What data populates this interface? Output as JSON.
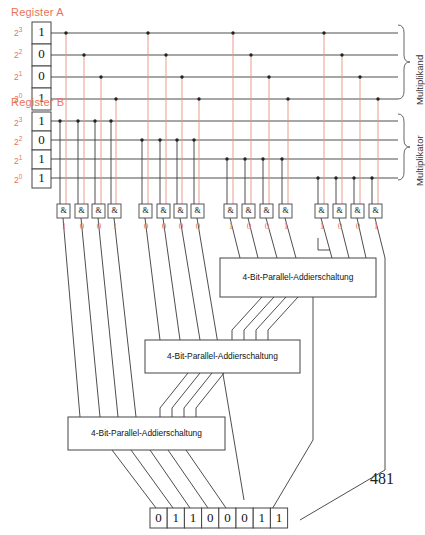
{
  "page": {
    "number": "481"
  },
  "registers": {
    "a": {
      "title": "Register A",
      "side_label": "Multiplikand",
      "bit_labels": [
        "2",
        "2",
        "2",
        "2"
      ],
      "bit_exponents": [
        "3",
        "2",
        "1",
        "0"
      ],
      "values": [
        "1",
        "0",
        "0",
        "1"
      ]
    },
    "b": {
      "title": "Register B",
      "side_label": "Multiplikator",
      "bit_labels": [
        "2",
        "2",
        "2",
        "2"
      ],
      "bit_exponents": [
        "3",
        "2",
        "1",
        "0"
      ],
      "values": [
        "1",
        "0",
        "1",
        "1"
      ]
    }
  },
  "gates": {
    "symbol": "&",
    "groups": [
      {
        "name": "group-0",
        "outputs": [
          "1",
          "0",
          "0",
          "1"
        ]
      },
      {
        "name": "group-1",
        "outputs": [
          "0",
          "0",
          "0",
          "0"
        ]
      },
      {
        "name": "group-2",
        "outputs": [
          "1",
          "0",
          "0",
          "1"
        ]
      },
      {
        "name": "group-3",
        "outputs": [
          "1",
          "0",
          "0",
          "1"
        ]
      }
    ]
  },
  "adders": [
    {
      "label": "4-Bit-Parallel-Addierschaltung"
    },
    {
      "label": "4-Bit-Parallel-Addierschaltung"
    },
    {
      "label": "4-Bit-Parallel-Addierschaltung"
    }
  ],
  "result": {
    "values": [
      "0",
      "1",
      "1",
      "0",
      "0",
      "0",
      "1",
      "1"
    ]
  },
  "colors": {
    "accent_red": "#e8735a",
    "wire_dark": "#3a3a3a",
    "wire_red": "#e8937f",
    "box_stroke": "#444444",
    "background": "#ffffff"
  }
}
